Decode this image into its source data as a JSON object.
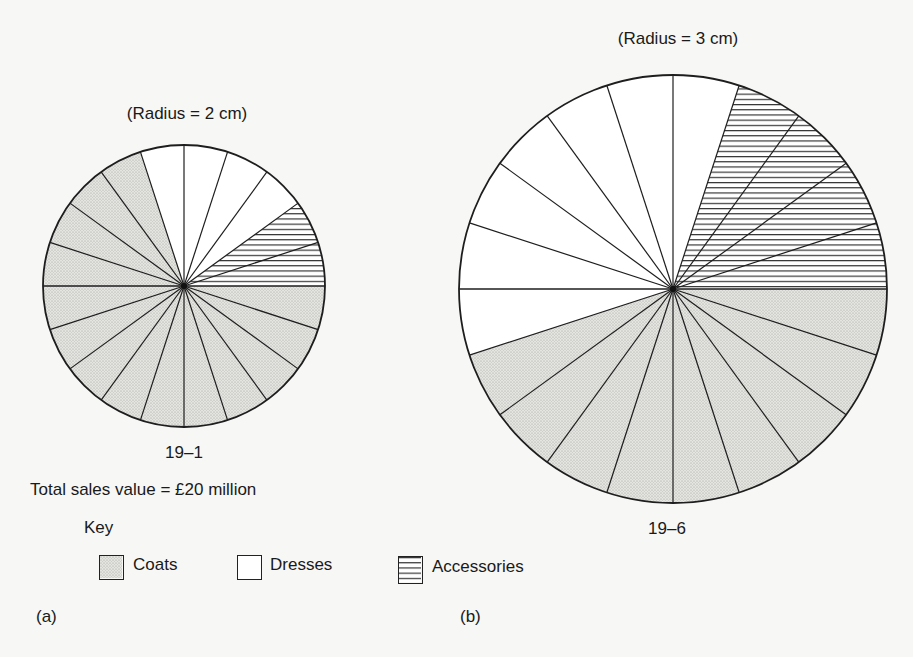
{
  "chart_data": [
    {
      "type": "pie",
      "panel": "(a)",
      "title": "(Radius = 2 cm)",
      "caption": "19–1",
      "note": "Total sales value = £20 million",
      "radius_cm": 2,
      "categories": [
        "Coats",
        "Dresses",
        "Accessories"
      ],
      "values": [
        70,
        20,
        10
      ],
      "unit": "percent",
      "slices_of_18deg": [
        14,
        4,
        2
      ],
      "start_angles_deg_ccw_from_east": {
        "Accessories": 0,
        "Dresses": 36,
        "Coats": 108
      }
    },
    {
      "type": "pie",
      "panel": "(b)",
      "title": "(Radius = 3 cm)",
      "caption": "19–6",
      "radius_cm": 3,
      "categories": [
        "Coats",
        "Dresses",
        "Accessories"
      ],
      "values": [
        45,
        35,
        20
      ],
      "unit": "percent",
      "slices_of_18deg": [
        9,
        7,
        4
      ],
      "start_angles_deg_ccw_from_east": {
        "Accessories": 0,
        "Dresses": 72,
        "Coats": 198
      }
    }
  ],
  "pieA": {
    "title": "(Radius = 2 cm)",
    "caption": "19–1",
    "total": "Total sales value = £20 million",
    "panel": "(a)",
    "cx": 184,
    "cy": 286,
    "r": 141,
    "segments": [
      {
        "name": "Accessories",
        "from": 0,
        "to": 36,
        "fill": "hatch"
      },
      {
        "name": "Dresses",
        "from": 36,
        "to": 108,
        "fill": "white"
      },
      {
        "name": "Coats",
        "from": 108,
        "to": 360,
        "fill": "stipple"
      }
    ]
  },
  "pieB": {
    "title": "(Radius = 3 cm)",
    "caption": "19–6",
    "panel": "(b)",
    "cx": 673,
    "cy": 289,
    "r": 214,
    "segments": [
      {
        "name": "Accessories",
        "from": 0,
        "to": 72,
        "fill": "hatch"
      },
      {
        "name": "Dresses",
        "from": 72,
        "to": 198,
        "fill": "white"
      },
      {
        "name": "Coats",
        "from": 198,
        "to": 360,
        "fill": "stipple"
      }
    ]
  },
  "key": {
    "title": "Key",
    "items": [
      {
        "label": "Coats",
        "fill": "stipple"
      },
      {
        "label": "Dresses",
        "fill": "white"
      },
      {
        "label": "Accessories",
        "fill": "hatch"
      }
    ]
  },
  "colors": {
    "line": "#1e1e1e",
    "stipple": "#d9d9d6",
    "white": "#ffffff",
    "background": "#f7f7f5"
  }
}
